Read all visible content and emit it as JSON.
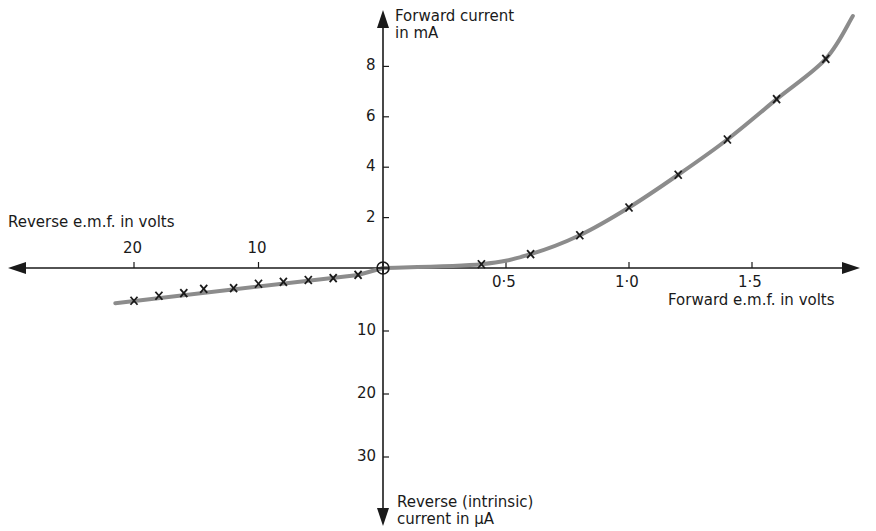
{
  "chart_data": {
    "type": "scatter",
    "title": "",
    "xlabel_forward": "Forward e.m.f. in volts",
    "xlabel_reverse": "Reverse e.m.f. in volts",
    "ylabel_forward_line1": "Forward current",
    "ylabel_forward_line2": "in mA",
    "ylabel_reverse_line1": "Reverse (intrinsic)",
    "ylabel_reverse_line2": "current in µA",
    "x_forward_ticks": [
      "0·5",
      "1·0",
      "1·5"
    ],
    "x_forward_tick_values": [
      0.5,
      1.0,
      1.5
    ],
    "x_reverse_ticks": [
      "20",
      "10"
    ],
    "x_reverse_tick_values": [
      20,
      10
    ],
    "y_forward_ticks": [
      "8",
      "6",
      "4",
      "2"
    ],
    "y_forward_tick_values": [
      8,
      6,
      4,
      2
    ],
    "y_reverse_ticks": [
      "10",
      "20",
      "30"
    ],
    "y_reverse_tick_values": [
      10,
      20,
      30
    ],
    "grid": false,
    "legend": null,
    "series": [
      {
        "name": "Forward characteristic",
        "x_unit": "V",
        "y_unit": "mA",
        "x": [
          0.0,
          0.4,
          0.6,
          0.8,
          1.0,
          1.2,
          1.4,
          1.6,
          1.8
        ],
        "y": [
          0.0,
          0.15,
          0.55,
          1.3,
          2.4,
          3.7,
          5.1,
          6.7,
          8.3
        ]
      },
      {
        "name": "Reverse characteristic",
        "x_unit": "V (reverse)",
        "y_unit": "µA (reverse)",
        "x": [
          0,
          2,
          4,
          6,
          8,
          10,
          12,
          14.4,
          16,
          18,
          20
        ],
        "y": [
          0,
          1.1,
          1.6,
          1.9,
          2.2,
          2.5,
          3.2,
          3.3,
          4.0,
          4.4,
          5.2
        ]
      }
    ],
    "marker": "x",
    "origin_marker": "circle-plus",
    "colors": {
      "axis": "#1a1a1a",
      "curve": "#8c8c8c",
      "marker": "#1a1a1a",
      "background": "#ffffff"
    }
  }
}
